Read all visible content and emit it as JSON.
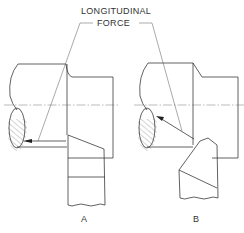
{
  "figure": {
    "callout": {
      "line1": "LONGITUDINAL",
      "line2": "FORCE"
    },
    "views": [
      {
        "id": "A",
        "label": "A",
        "description": "Tool bit set square to work; longitudinal force acts parallel to axis"
      },
      {
        "id": "B",
        "label": "B",
        "description": "Tool bit set at angle; longitudinal force acts at an angle toward shaft"
      }
    ],
    "colors": {
      "line": "#3a3a3a",
      "background": "#ffffff"
    }
  }
}
